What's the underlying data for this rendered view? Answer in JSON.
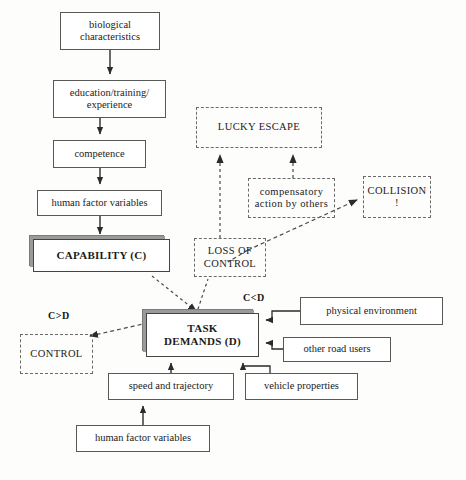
{
  "diagram": {
    "colors": {
      "solid_border": "#585858",
      "dashed_border": "#6a6a6a",
      "shadow": "#8e8e8e",
      "text": "#1b1b1b",
      "background": "#fdfdfc"
    },
    "nodes": [
      {
        "id": "biological",
        "label": "biological characteristics",
        "line1": "biological",
        "line2": "characteristics",
        "style": "solid",
        "x": 60,
        "y": 12,
        "w": 100,
        "h": 38
      },
      {
        "id": "education",
        "label": "education/training/ experience",
        "line1": "education/training/",
        "line2": "experience",
        "style": "solid",
        "x": 53,
        "y": 80,
        "w": 113,
        "h": 38
      },
      {
        "id": "competence",
        "label": "competence",
        "line1": "competence",
        "line2": "",
        "style": "solid",
        "x": 53,
        "y": 140,
        "w": 93,
        "h": 28
      },
      {
        "id": "human-factor-variables-top",
        "label": "human factor variables",
        "line1": "human factor variables",
        "line2": "",
        "style": "solid",
        "x": 37,
        "y": 190,
        "w": 125,
        "h": 26
      },
      {
        "id": "capability",
        "label": "CAPABILITY (C)",
        "line1": "CAPABILITY (C)",
        "line2": "",
        "style": "shadowed",
        "x": 33,
        "y": 239,
        "w": 137,
        "h": 33
      },
      {
        "id": "lucky-escape",
        "label": "LUCKY ESCAPE",
        "line1": "LUCKY ESCAPE",
        "line2": "",
        "style": "dashed",
        "x": 196,
        "y": 107,
        "w": 126,
        "h": 41
      },
      {
        "id": "compensatory",
        "label": "compensatory action by others",
        "line1": "compensatory",
        "line2": "action by others",
        "style": "dashed",
        "x": 248,
        "y": 178,
        "w": 87,
        "h": 40
      },
      {
        "id": "collision",
        "label": "COLLISION !",
        "line1": "COLLISION",
        "line2": "!",
        "style": "dashed",
        "x": 363,
        "y": 176,
        "w": 68,
        "h": 42
      },
      {
        "id": "loss-of-control",
        "label": "LOSS OF CONTROL",
        "line1": "LOSS OF",
        "line2": "CONTROL",
        "style": "dashed",
        "x": 194,
        "y": 238,
        "w": 72,
        "h": 39
      },
      {
        "id": "task-demands",
        "label": "TASK DEMANDS (D)",
        "line1": "TASK",
        "line2": "DEMANDS (D)",
        "style": "shadowed",
        "x": 146,
        "y": 313,
        "w": 113,
        "h": 44
      },
      {
        "id": "control",
        "label": "CONTROL",
        "line1": "CONTROL",
        "line2": "",
        "style": "dashed",
        "x": 20,
        "y": 334,
        "w": 73,
        "h": 40
      },
      {
        "id": "physical-environment",
        "label": "physical environment",
        "line1": "physical environment",
        "line2": "",
        "style": "solid",
        "x": 300,
        "y": 297,
        "w": 143,
        "h": 28
      },
      {
        "id": "other-road-users",
        "label": "other road users",
        "line1": "other road users",
        "line2": "",
        "style": "solid",
        "x": 283,
        "y": 337,
        "w": 108,
        "h": 25
      },
      {
        "id": "speed-and-trajectory",
        "label": "speed and trajectory",
        "line1": "speed and trajectory",
        "line2": "",
        "style": "solid",
        "x": 108,
        "y": 373,
        "w": 126,
        "h": 27
      },
      {
        "id": "vehicle-properties",
        "label": "vehicle properties",
        "line1": "vehicle properties",
        "line2": "",
        "style": "solid",
        "x": 245,
        "y": 373,
        "w": 113,
        "h": 27
      },
      {
        "id": "human-factor-variables-bottom",
        "label": "human factor variables",
        "line1": "human factor variables",
        "line2": "",
        "style": "solid",
        "x": 76,
        "y": 425,
        "w": 134,
        "h": 27
      }
    ],
    "annotations": [
      {
        "id": "c-greater-d",
        "label": "C>D",
        "x": 48,
        "y": 310
      },
      {
        "id": "c-less-d",
        "label": "C<D",
        "x": 243,
        "y": 292
      }
    ],
    "edges": [
      {
        "id": "biological-to-education",
        "from": "biological",
        "to": "education",
        "style": "solid-arrow"
      },
      {
        "id": "education-to-competence",
        "from": "education",
        "to": "competence",
        "style": "solid-arrow"
      },
      {
        "id": "competence-to-human-factor-variables",
        "from": "competence",
        "to": "human-factor-variables-top",
        "style": "solid-arrow"
      },
      {
        "id": "human-factor-variables-to-capability",
        "from": "human-factor-variables-top",
        "to": "capability",
        "style": "solid-arrow"
      },
      {
        "id": "loss-of-control-to-lucky-escape",
        "from": "loss-of-control",
        "to": "lucky-escape",
        "style": "dashed-arrow"
      },
      {
        "id": "compensatory-to-lucky-escape",
        "from": "compensatory",
        "to": "lucky-escape",
        "style": "dashed-arrow"
      },
      {
        "id": "loss-of-control-to-collision",
        "from": "loss-of-control",
        "to": "collision",
        "style": "dashed-arrow"
      },
      {
        "id": "task-demands-to-loss-of-control",
        "from": "task-demands",
        "to": "loss-of-control",
        "style": "dashed-arrow"
      },
      {
        "id": "capability-to-task-demands",
        "from": "capability",
        "to": "task-demands",
        "style": "dashed-arrow"
      },
      {
        "id": "task-demands-to-control",
        "from": "task-demands",
        "to": "control",
        "style": "dashed-arrow"
      },
      {
        "id": "physical-environment-to-task-demands",
        "from": "physical-environment",
        "to": "task-demands",
        "style": "solid-arrow"
      },
      {
        "id": "other-road-users-to-task-demands",
        "from": "other-road-users",
        "to": "task-demands",
        "style": "solid-arrow"
      },
      {
        "id": "speed-and-trajectory-to-task-demands",
        "from": "speed-and-trajectory",
        "to": "task-demands",
        "style": "solid-arrow"
      },
      {
        "id": "vehicle-properties-to-task-demands",
        "from": "vehicle-properties",
        "to": "task-demands",
        "style": "solid-arrow"
      },
      {
        "id": "human-factor-variables-to-speed-and-trajectory",
        "from": "human-factor-variables-bottom",
        "to": "speed-and-trajectory",
        "style": "solid-arrow"
      }
    ]
  }
}
